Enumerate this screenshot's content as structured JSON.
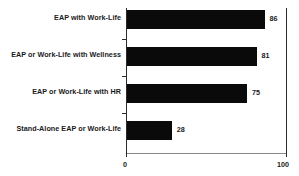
{
  "chart_data": {
    "type": "bar",
    "orientation": "horizontal",
    "title": "",
    "xlabel": "",
    "ylabel": "",
    "xlim": [
      0,
      100
    ],
    "grid": false,
    "legend": null,
    "categories": [
      "EAP with Work-Life",
      "EAP or Work-Life with Wellness",
      "EAP or Work-Life with HR",
      "Stand-Alone EAP or Work-Life"
    ],
    "values": [
      86,
      81,
      75,
      28
    ],
    "value_labels": [
      "86",
      "81",
      "75",
      "28"
    ],
    "xticks": [
      0,
      100
    ],
    "xtick_labels": [
      "0",
      "100"
    ],
    "colors": {
      "bar": "#0a0a0a",
      "axis": "#2b2b2b",
      "baseline": "#8a8a8a",
      "text": "#1a1a1a",
      "background": "#ffffff"
    }
  }
}
